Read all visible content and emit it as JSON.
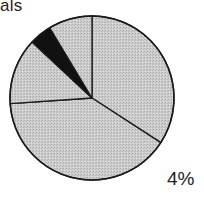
{
  "chart_data": {
    "type": "pie",
    "visible_title_fragment": "als",
    "center": [
      92,
      98
    ],
    "radius": 82,
    "slices": [
      {
        "name": "slice-1",
        "start_deg": 0,
        "end_deg": 123,
        "percent": 34,
        "fill": "#c8c8c8"
      },
      {
        "name": "slice-2",
        "start_deg": 123,
        "end_deg": 266,
        "percent": 40,
        "fill": "#c8c8c8"
      },
      {
        "name": "slice-3",
        "start_deg": 266,
        "end_deg": 313,
        "percent": 13,
        "fill": "#c8c8c8"
      },
      {
        "name": "slice-4",
        "start_deg": 313,
        "end_deg": 329,
        "percent": 4,
        "fill": "#111111"
      },
      {
        "name": "slice-5",
        "start_deg": 329,
        "end_deg": 360,
        "percent": 9,
        "fill": "#c8c8c8"
      }
    ],
    "annotations": [
      {
        "text": "4%",
        "position": "bottom-right"
      }
    ],
    "legend": null
  },
  "labels": {
    "title_fragment": "als",
    "percent_label": "4%"
  },
  "colors": {
    "slice_fill": "#c8c8c8",
    "highlight_fill": "#111111",
    "stroke": "#1a1a1a",
    "background": "#ffffff"
  }
}
